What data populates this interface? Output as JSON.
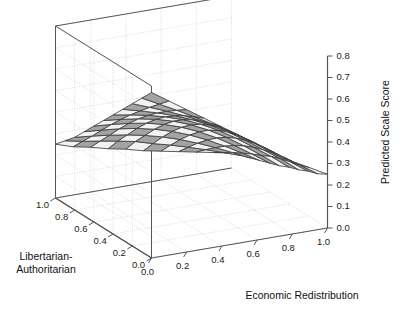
{
  "chart_data": {
    "type": "surface",
    "title": "",
    "xlabel": "Economic Redistribution",
    "ylabel": "Libertarian-Authoritarian",
    "ylabel_line1": "Libertarian-",
    "ylabel_line2": "Authoritarian",
    "zlabel": "Predicted Scale Score",
    "xlim": [
      0.0,
      1.0
    ],
    "ylim": [
      0.0,
      1.0
    ],
    "zlim": [
      0.0,
      0.8
    ],
    "xticks": [
      "0.0",
      "0.2",
      "0.4",
      "0.6",
      "0.8",
      "1.0"
    ],
    "yticks": [
      "0.0",
      "0.2",
      "0.4",
      "0.6",
      "0.8",
      "1.0"
    ],
    "zticks": [
      "0.0",
      "0.1",
      "0.2",
      "0.3",
      "0.4",
      "0.5",
      "0.6",
      "0.7",
      "0.8"
    ],
    "xtick_values": [
      0.0,
      0.2,
      0.4,
      0.6,
      0.8,
      1.0
    ],
    "ytick_values": [
      0.0,
      0.2,
      0.4,
      0.6,
      0.8,
      1.0
    ],
    "ztick_values": [
      0.0,
      0.1,
      0.2,
      0.3,
      0.4,
      0.5,
      0.6,
      0.7,
      0.8
    ],
    "grid": true,
    "legend": "none",
    "x": [
      0.0,
      0.1,
      0.2,
      0.3,
      0.4,
      0.5,
      0.6,
      0.7,
      0.8,
      0.9,
      1.0
    ],
    "y": [
      0.0,
      0.1,
      0.2,
      0.3,
      0.4,
      0.5,
      0.6,
      0.7,
      0.8,
      0.9,
      1.0
    ],
    "z_note": "Predicted scale score surface, saddle-shaped: high at low Economic Redistribution / high Libertarian-Authoritarian, low at high Economic Redistribution / low Libertarian-Authoritarian",
    "z": [
      [
        0.8,
        0.74,
        0.68,
        0.62,
        0.56,
        0.5,
        0.44,
        0.38,
        0.32,
        0.27,
        0.22
      ],
      [
        0.74,
        0.685,
        0.63,
        0.575,
        0.52,
        0.465,
        0.41,
        0.355,
        0.3,
        0.25,
        0.2
      ],
      [
        0.68,
        0.63,
        0.58,
        0.53,
        0.48,
        0.43,
        0.38,
        0.33,
        0.28,
        0.235,
        0.19
      ],
      [
        0.62,
        0.575,
        0.53,
        0.485,
        0.44,
        0.395,
        0.35,
        0.305,
        0.26,
        0.22,
        0.175
      ],
      [
        0.56,
        0.52,
        0.48,
        0.44,
        0.4,
        0.36,
        0.32,
        0.28,
        0.24,
        0.205,
        0.165
      ],
      [
        0.5,
        0.465,
        0.43,
        0.395,
        0.36,
        0.325,
        0.29,
        0.255,
        0.22,
        0.185,
        0.15
      ],
      [
        0.44,
        0.41,
        0.38,
        0.35,
        0.32,
        0.29,
        0.26,
        0.23,
        0.2,
        0.17,
        0.14
      ],
      [
        0.38,
        0.355,
        0.33,
        0.305,
        0.28,
        0.255,
        0.23,
        0.205,
        0.18,
        0.155,
        0.13
      ],
      [
        0.32,
        0.3,
        0.28,
        0.26,
        0.24,
        0.22,
        0.2,
        0.18,
        0.16,
        0.14,
        0.12
      ],
      [
        0.27,
        0.25,
        0.235,
        0.22,
        0.205,
        0.185,
        0.17,
        0.155,
        0.14,
        0.125,
        0.11
      ],
      [
        0.22,
        0.2,
        0.19,
        0.175,
        0.165,
        0.15,
        0.14,
        0.13,
        0.12,
        0.11,
        0.1
      ]
    ],
    "colors": {
      "surface_light": "#f2f2f2",
      "surface_dark": "#a3a3a3",
      "mesh_line": "#3d3d3d",
      "axis_line": "#555555",
      "grid_line": "#cfcfcf",
      "text": "#1a1a1a",
      "background": "#ffffff"
    }
  }
}
